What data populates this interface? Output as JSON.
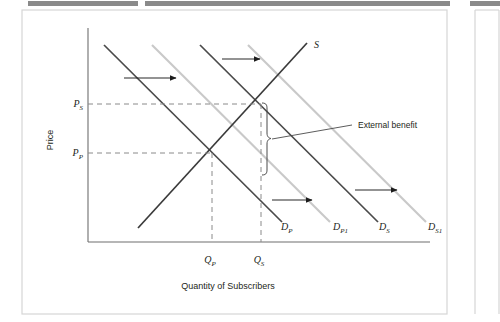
{
  "figure": {
    "kind": "economics-supply-demand-diagram",
    "axis": {
      "y_label": "Price",
      "x_label": "Quantity of Subscribers",
      "y_ticks": [
        "P_S",
        "P_P"
      ],
      "y_tick_display": [
        "P",
        "P"
      ],
      "y_tick_sub": [
        "S",
        "P"
      ],
      "x_ticks": [
        "Q_P",
        "Q_S"
      ],
      "x_tick_display": [
        "Q",
        "Q"
      ],
      "x_tick_sub": [
        "P",
        "S"
      ]
    },
    "curves": [
      {
        "id": "supply",
        "label": "S",
        "sub": "",
        "color": "#3a3a3a",
        "type": "supply"
      },
      {
        "id": "demand-private",
        "label": "D",
        "sub": "P",
        "color": "#4a4a4a",
        "type": "demand"
      },
      {
        "id": "demand-private-1",
        "label": "D",
        "sub": "P1",
        "color": "#c9c9c9",
        "type": "demand"
      },
      {
        "id": "demand-social",
        "label": "D",
        "sub": "S",
        "color": "#4a4a4a",
        "type": "demand"
      },
      {
        "id": "demand-social-1",
        "label": "D",
        "sub": "S1",
        "color": "#c9c9c9",
        "type": "demand"
      }
    ],
    "annotation": {
      "external_benefit": "External benefit"
    },
    "colors": {
      "curve_dark": "#4a4a4a",
      "curve_light": "#c9c9c9",
      "axis": "#6e6e6e",
      "dashed": "#8a8a8a",
      "text": "#231f20",
      "page_bar": "#7a7a7a",
      "panel_border": "#d6d6d6"
    },
    "shift_arrows": 4,
    "equilibria": [
      {
        "name": "private",
        "price": "P_P",
        "quantity": "Q_P"
      },
      {
        "name": "social",
        "price": "P_S",
        "quantity": "Q_S"
      }
    ]
  }
}
